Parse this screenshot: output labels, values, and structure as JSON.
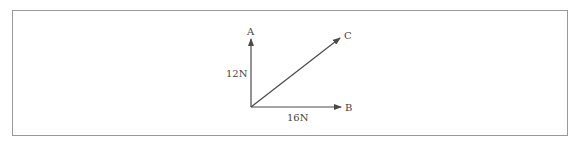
{
  "diagram": {
    "type": "force-vector-diagram",
    "vectors": [
      {
        "id": "A",
        "label": "A",
        "magnitude_label": "12N",
        "direction": "up"
      },
      {
        "id": "B",
        "label": "B",
        "magnitude_label": "16N",
        "direction": "right"
      },
      {
        "id": "C",
        "label": "C",
        "magnitude_label": "",
        "direction": "diagonal-up-right"
      }
    ],
    "colors": {
      "line": "#4a4a4a",
      "border": "#9a9a9a",
      "text": "#444444"
    }
  }
}
